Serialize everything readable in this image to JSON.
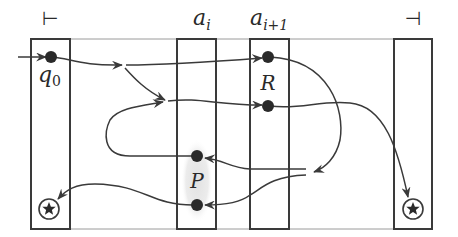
{
  "diagram": {
    "columns": [
      {
        "id": "left-endmarker",
        "label": "⊢"
      },
      {
        "id": "a-i",
        "label": "a",
        "sub": "i"
      },
      {
        "id": "a-i-plus-1",
        "label": "a",
        "sub": "i+1"
      },
      {
        "id": "right-endmarker",
        "label": "⊣"
      }
    ],
    "states": {
      "start": {
        "label": "q",
        "sub": "0"
      },
      "R": {
        "label": "R"
      },
      "P": {
        "label": "P"
      }
    },
    "accepting_marker": "star-in-circle",
    "colors": {
      "stroke": "#3a3a3a",
      "dot": "#2a2a2a",
      "highlight": "#e6e6e6",
      "rail": "#9a9a9a"
    }
  }
}
